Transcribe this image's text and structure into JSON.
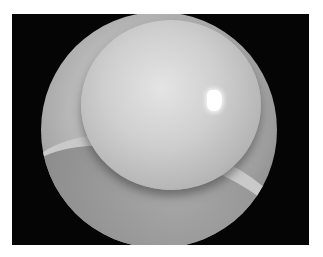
{
  "image": {
    "subject": "close-up photograph of an eye with a large dome-shaped bulging opaque lesion",
    "background_color": "#050505",
    "frame_color": "#ffffff",
    "specular_highlight": "small bright white reflection upper right of dome"
  }
}
